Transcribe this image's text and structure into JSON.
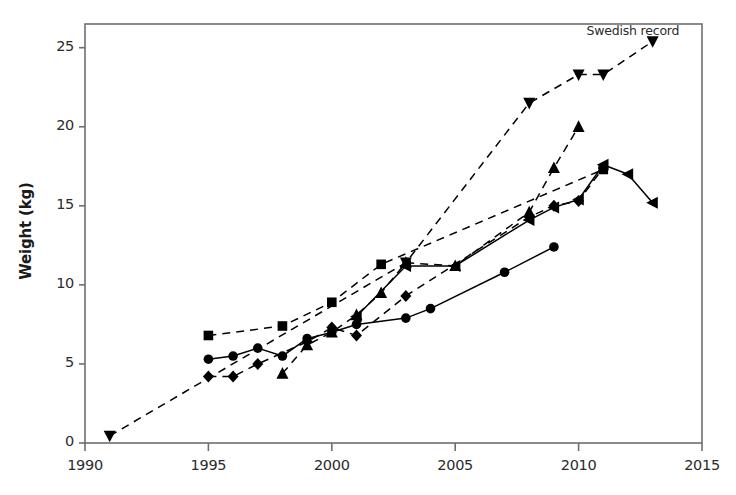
{
  "chart_data": {
    "type": "line",
    "title": "",
    "subtitle": "",
    "xlabel": "",
    "ylabel": "Weight (kg)",
    "xlim": [
      1990,
      2015
    ],
    "ylim": [
      0,
      26.5
    ],
    "xticks": [
      1990,
      1995,
      2000,
      2005,
      2010,
      2015
    ],
    "yticks": [
      0,
      5,
      10,
      15,
      20,
      25
    ],
    "xtick_labels": [
      "1990",
      "1995",
      "2000",
      "2005",
      "2010",
      "2015"
    ],
    "ytick_labels": [
      "0",
      "5",
      "10",
      "15",
      "20",
      "25"
    ],
    "grid": false,
    "legend": "none",
    "annotations": [
      {
        "text": "Swedish record",
        "x": 2012.2,
        "y": 26.0,
        "anchor": "middle"
      }
    ],
    "series": [
      {
        "name": "down-triangle-dashed",
        "marker": "triangle-down",
        "linestyle": "dashed",
        "color": "#000000",
        "points": [
          {
            "x": 1991,
            "y": 0.45
          },
          {
            "x": 2003,
            "y": 11.4
          },
          {
            "x": 2008,
            "y": 21.5
          },
          {
            "x": 2010,
            "y": 23.3
          },
          {
            "x": 2011,
            "y": 23.3
          },
          {
            "x": 2013,
            "y": 25.4
          }
        ]
      },
      {
        "name": "up-triangle-dashed",
        "marker": "triangle-up",
        "linestyle": "dashed",
        "color": "#000000",
        "points": [
          {
            "x": 1998,
            "y": 4.4
          },
          {
            "x": 1999,
            "y": 6.2
          },
          {
            "x": 2000,
            "y": 7.0
          },
          {
            "x": 2001,
            "y": 8.1
          },
          {
            "x": 2002,
            "y": 9.5
          },
          {
            "x": 2003,
            "y": 11.4
          },
          {
            "x": 2005,
            "y": 11.2
          },
          {
            "x": 2008,
            "y": 14.6
          },
          {
            "x": 2009,
            "y": 17.4
          },
          {
            "x": 2010,
            "y": 20.0
          }
        ]
      },
      {
        "name": "square-dashed",
        "marker": "square",
        "linestyle": "dashed",
        "color": "#000000",
        "points": [
          {
            "x": 1995,
            "y": 6.8
          },
          {
            "x": 1998,
            "y": 7.4
          },
          {
            "x": 2000,
            "y": 8.9
          },
          {
            "x": 2002,
            "y": 11.3
          },
          {
            "x": 2011,
            "y": 17.3
          }
        ]
      },
      {
        "name": "left-triangle-solid",
        "marker": "triangle-left",
        "linestyle": "solid",
        "color": "#000000",
        "points": [
          {
            "x": 2001,
            "y": 8.0
          },
          {
            "x": 2003,
            "y": 11.2
          },
          {
            "x": 2005,
            "y": 11.2
          },
          {
            "x": 2008,
            "y": 14.1
          },
          {
            "x": 2009,
            "y": 14.9
          },
          {
            "x": 2010,
            "y": 15.4
          },
          {
            "x": 2011,
            "y": 17.6
          },
          {
            "x": 2012,
            "y": 17.0
          },
          {
            "x": 2013,
            "y": 15.2
          }
        ]
      },
      {
        "name": "diamond-dashed",
        "marker": "diamond",
        "linestyle": "dashed",
        "color": "#000000",
        "points": [
          {
            "x": 1995,
            "y": 4.2
          },
          {
            "x": 1996,
            "y": 4.2
          },
          {
            "x": 1997,
            "y": 5.0
          },
          {
            "x": 1999,
            "y": 6.4
          },
          {
            "x": 2000,
            "y": 7.3
          },
          {
            "x": 2001,
            "y": 6.8
          },
          {
            "x": 2003,
            "y": 9.3
          },
          {
            "x": 2008,
            "y": 14.3
          },
          {
            "x": 2009,
            "y": 15.0
          },
          {
            "x": 2010,
            "y": 15.3
          },
          {
            "x": 2011,
            "y": 17.4
          }
        ]
      },
      {
        "name": "circle-solid",
        "marker": "circle",
        "linestyle": "solid",
        "color": "#000000",
        "points": [
          {
            "x": 1995,
            "y": 5.3
          },
          {
            "x": 1996,
            "y": 5.5
          },
          {
            "x": 1997,
            "y": 6.0
          },
          {
            "x": 1998,
            "y": 5.5
          },
          {
            "x": 1999,
            "y": 6.6
          },
          {
            "x": 2000,
            "y": 7.0
          },
          {
            "x": 2001,
            "y": 7.5
          },
          {
            "x": 2003,
            "y": 7.9
          },
          {
            "x": 2004,
            "y": 8.5
          },
          {
            "x": 2007,
            "y": 10.8
          },
          {
            "x": 2009,
            "y": 12.4
          }
        ]
      }
    ]
  },
  "plot": {
    "frame_color": "#6e6e6e",
    "ink_color": "#000000",
    "background": "#ffffff"
  }
}
